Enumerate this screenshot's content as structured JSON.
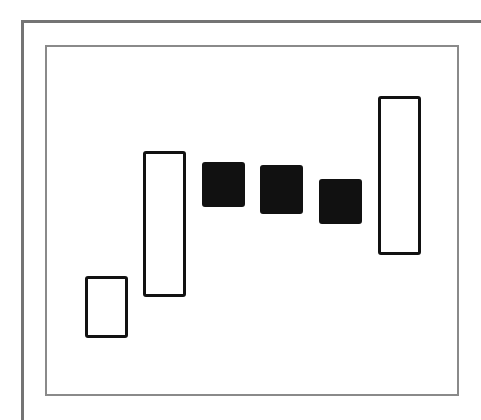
{
  "chart_data": {
    "type": "candlestick",
    "title": "",
    "xlabel": "",
    "ylabel": "",
    "ylim": [
      0,
      100
    ],
    "grid": false,
    "legend": null,
    "categories": [
      "1",
      "2",
      "3",
      "4",
      "5",
      "6"
    ],
    "series": [
      {
        "name": "candles",
        "values": [
          {
            "open": 16,
            "close": 34,
            "direction": "up"
          },
          {
            "open": 28,
            "close": 70,
            "direction": "up"
          },
          {
            "open": 67,
            "close": 54,
            "direction": "down"
          },
          {
            "open": 66,
            "close": 52,
            "direction": "down"
          },
          {
            "open": 62,
            "close": 49,
            "direction": "down"
          },
          {
            "open": 40,
            "close": 86,
            "direction": "up"
          }
        ]
      }
    ],
    "style": {
      "up_fill": "#ffffff",
      "down_fill": "#111111",
      "body_outline": "#111111",
      "frame_color": "#8a8a8a",
      "outer_frame_color": "#747474"
    }
  }
}
